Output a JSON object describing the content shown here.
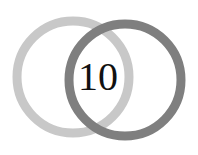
{
  "label": "10",
  "colors": {
    "left_ring": "#c8c8c8",
    "right_ring": "#808080",
    "text": "#111111"
  }
}
